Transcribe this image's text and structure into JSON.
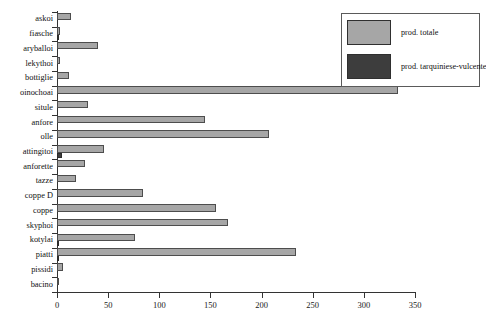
{
  "chart_data": {
    "type": "bar",
    "orientation": "horizontal",
    "title": "",
    "xlabel": "",
    "ylabel": "",
    "xlim": [
      0,
      350
    ],
    "xticks": [
      0,
      50,
      100,
      150,
      200,
      250,
      300,
      350
    ],
    "grid": false,
    "legend_position": "top-right",
    "categories": [
      "askoi",
      "fiasche",
      "aryballoi",
      "lekythoi",
      "bottiglie",
      "oinochoai",
      "situle",
      "anfore",
      "olle",
      "attingitoi",
      "anforette",
      "tazze",
      "coppe D",
      "coppe",
      "skyphoi",
      "kotylai",
      "piatti",
      "pissidi",
      "bacino"
    ],
    "series": [
      {
        "name": "prod. totale",
        "color": "#a6a6a6",
        "values": [
          14,
          3,
          40,
          3,
          12,
          333,
          30,
          145,
          207,
          46,
          27,
          19,
          84,
          155,
          167,
          76,
          234,
          6,
          1
        ]
      },
      {
        "name": "prod. tarquiniese-vulcente",
        "color": "#3d3d3d",
        "values": [
          0,
          1,
          0,
          0,
          0,
          0,
          0,
          0,
          0,
          5,
          0,
          0,
          0,
          0,
          0,
          2,
          2,
          0,
          0
        ]
      }
    ]
  },
  "legend": {
    "items": [
      {
        "label": "prod. totale",
        "swatch": "light-gray-swatch"
      },
      {
        "label": "prod. tarquiniese-vulcente",
        "swatch": "dark-gray-swatch"
      }
    ]
  },
  "colors": {
    "series_total": "#a6a6a6",
    "series_local": "#3d3d3d",
    "axis": "#333333",
    "background": "#ffffff"
  }
}
